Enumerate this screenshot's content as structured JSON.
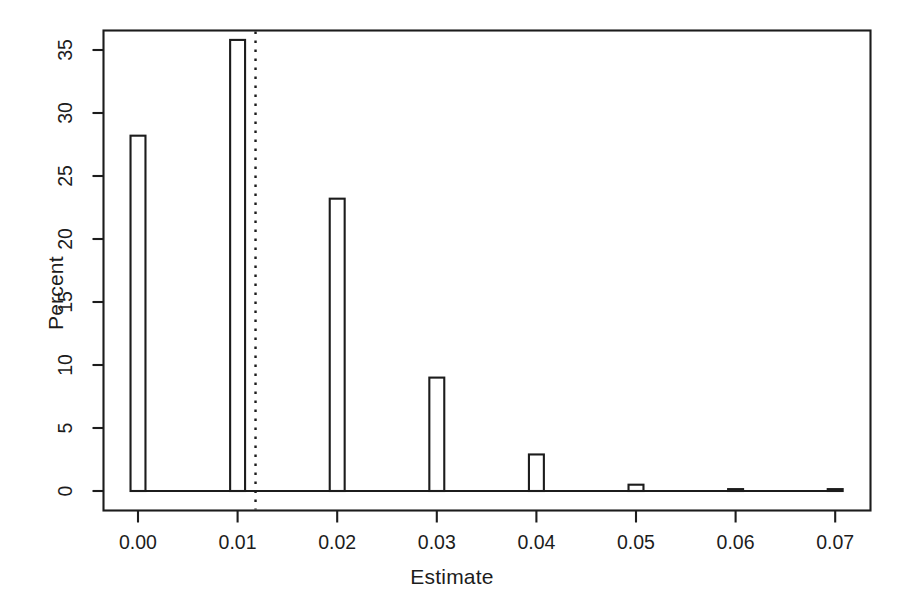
{
  "figure": {
    "background_color": "#ffffff",
    "ink_color": "#1c1c1c",
    "width": 904,
    "height": 607
  },
  "chart_data": {
    "type": "bar",
    "title": "",
    "subtitle": "",
    "xlabel": "Estimate",
    "ylabel": "Percent",
    "categories": [
      "0.00",
      "0.01",
      "0.02",
      "0.03",
      "0.04",
      "0.05",
      "0.06",
      "0.07"
    ],
    "x": [
      0.0,
      0.01,
      0.02,
      0.03,
      0.04,
      0.05,
      0.06,
      0.07
    ],
    "values": [
      28.2,
      35.8,
      23.2,
      9.0,
      2.9,
      0.5,
      0.15,
      0.15
    ],
    "xlim": [
      -0.0035,
      0.0735
    ],
    "ylim": [
      0,
      37.2
    ],
    "xticks": [
      0.0,
      0.01,
      0.02,
      0.03,
      0.04,
      0.05,
      0.06,
      0.07
    ],
    "xtick_labels": [
      "0.00",
      "0.01",
      "0.02",
      "0.03",
      "0.04",
      "0.05",
      "0.06",
      "0.07"
    ],
    "yticks": [
      0,
      5,
      10,
      15,
      20,
      25,
      30,
      35
    ],
    "ytick_labels": [
      "0",
      "5",
      "10",
      "15",
      "20",
      "25",
      "30",
      "35"
    ],
    "grid": false,
    "legend": null,
    "bar_fill": "none",
    "bar_edge_color": "#1c1c1c",
    "bar_width": 0.0015,
    "annotations": [
      {
        "name": "reference-line",
        "type": "vertical-dashed-line",
        "x": 0.0118,
        "color": "#1c1c1c",
        "style": "dotted"
      }
    ]
  }
}
